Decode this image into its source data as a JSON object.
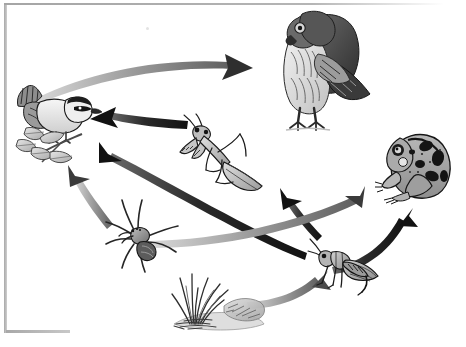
{
  "diagram": {
    "type": "food-web",
    "style": "black-and-white scientific illustration",
    "background_color": "#ffffff",
    "frame_color": "#a8a8a8",
    "arrow_colors": {
      "dark": "#1c1c1c",
      "gray": "#8a8a8a"
    },
    "organisms": [
      {
        "id": "hawk",
        "label": "Hawk",
        "role": "tertiary consumer",
        "x": 258,
        "y": 4,
        "width": 118,
        "height": 128,
        "facing": "left"
      },
      {
        "id": "songbird",
        "label": "Songbird",
        "role": "secondary consumer",
        "x": 10,
        "y": 80,
        "width": 96,
        "height": 90,
        "facing": "right"
      },
      {
        "id": "frog",
        "label": "Frog",
        "role": "secondary consumer",
        "x": 374,
        "y": 124,
        "width": 84,
        "height": 80,
        "facing": "left"
      },
      {
        "id": "mantis",
        "label": "Praying Mantis",
        "role": "secondary consumer",
        "x": 178,
        "y": 114,
        "width": 94,
        "height": 82,
        "facing": "upper-left"
      },
      {
        "id": "spider",
        "label": "Wolf Spider",
        "role": "secondary consumer",
        "x": 104,
        "y": 196,
        "width": 82,
        "height": 78,
        "facing": "left"
      },
      {
        "id": "grasshopper",
        "label": "Grasshopper",
        "role": "primary consumer",
        "x": 308,
        "y": 238,
        "width": 74,
        "height": 60,
        "facing": "left"
      },
      {
        "id": "grass",
        "label": "Grass",
        "role": "producer",
        "x": 168,
        "y": 262,
        "width": 106,
        "height": 72,
        "facing": "right"
      }
    ],
    "arrows": [
      {
        "id": "songbird-to-hawk",
        "from": "songbird",
        "to": "hawk",
        "color": "gray",
        "label": "songbird eaten by hawk"
      },
      {
        "id": "mantis-to-songbird",
        "from": "mantis",
        "to": "songbird",
        "color": "dark",
        "label": "mantis eaten by songbird"
      },
      {
        "id": "grasshopper-to-songbird",
        "from": "grasshopper",
        "to": "songbird",
        "color": "dark",
        "label": "grasshopper eaten by songbird"
      },
      {
        "id": "spider-to-songbird",
        "from": "spider",
        "to": "songbird",
        "color": "gray",
        "label": "spider eaten by songbird"
      },
      {
        "id": "grasshopper-to-mantis",
        "from": "grasshopper",
        "to": "mantis",
        "color": "dark",
        "label": "grasshopper eaten by mantis"
      },
      {
        "id": "spider-to-frog",
        "from": "spider",
        "to": "frog",
        "color": "gray",
        "label": "spider eaten by frog"
      },
      {
        "id": "grasshopper-to-frog",
        "from": "grasshopper",
        "to": "frog",
        "color": "dark",
        "label": "grasshopper eaten by frog"
      },
      {
        "id": "grass-to-grasshopper",
        "from": "grass",
        "to": "grasshopper",
        "color": "gray",
        "label": "grass eaten by grasshopper"
      }
    ],
    "speck": {
      "x": 146,
      "y": 27
    }
  }
}
